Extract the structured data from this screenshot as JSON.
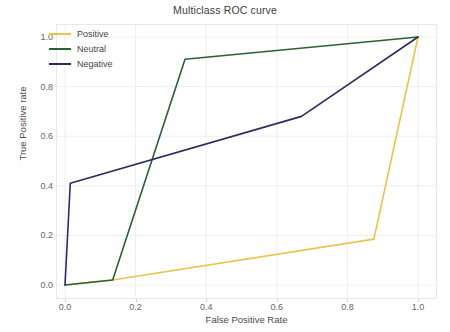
{
  "chart_data": {
    "type": "line",
    "title": "Multiclass ROC curve",
    "xlabel": "False Positive Rate",
    "ylabel": "True Positive rate",
    "xlim": [
      -0.03,
      1.05
    ],
    "ylim": [
      -0.045,
      1.05
    ],
    "xticks": [
      "0.0",
      "0.2",
      "0.4",
      "0.6",
      "0.8",
      "1.0"
    ],
    "xtick_values": [
      0.0,
      0.2,
      0.4,
      0.6,
      0.8,
      1.0
    ],
    "yticks": [
      "0.0",
      "0.2",
      "0.4",
      "0.6",
      "0.8",
      "1.0"
    ],
    "ytick_values": [
      0.0,
      0.2,
      0.4,
      0.6,
      0.8,
      1.0
    ],
    "grid": true,
    "legend_position": "upper left",
    "series": [
      {
        "name": "Positive",
        "color": "#E8C44D",
        "x": [
          0.0,
          0.135,
          0.875,
          1.0
        ],
        "y": [
          0.0,
          0.02,
          0.185,
          1.0
        ]
      },
      {
        "name": "Neutral",
        "color": "#2B6034",
        "x": [
          0.0,
          0.135,
          0.34,
          1.0
        ],
        "y": [
          0.0,
          0.02,
          0.91,
          1.0
        ]
      },
      {
        "name": "Negative",
        "color": "#2B2B5E",
        "x": [
          0.0,
          0.015,
          0.67,
          1.0
        ],
        "y": [
          0.0,
          0.41,
          0.68,
          1.0
        ]
      }
    ]
  },
  "figure": {
    "background": "#ffffff",
    "grid_color": "#eeeeee",
    "frame_color": "#e8e8e8",
    "tick_text_color": "#666666",
    "axis_label_color": "#4a4a4a",
    "title_color": "#3c3c3c"
  }
}
